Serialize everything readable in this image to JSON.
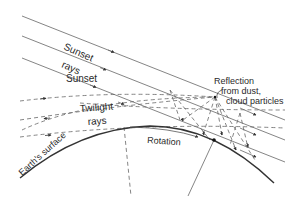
{
  "diagram": {
    "labels": {
      "sunset": "Sunset",
      "sunset_rays": "rays",
      "twilight": "Twilight",
      "twilight_rays": "rays",
      "reflection_line1": "Reflection",
      "reflection_line2": "from dust,",
      "reflection_line3": "cloud particles",
      "rotation": "Rotation",
      "earth_surface": "Earth's surface"
    },
    "colors": {
      "line": "#555555",
      "surface": "#333333",
      "text": "#2a2a2a"
    }
  }
}
